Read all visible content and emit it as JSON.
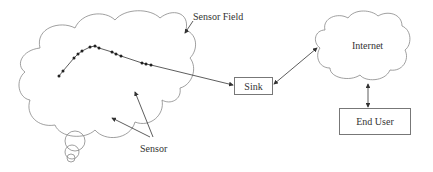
{
  "diagram": {
    "labels": {
      "sensor_field": "Sensor Field",
      "sensor": "Sensor",
      "sink": "Sink",
      "internet": "Internet",
      "end_user": "End User"
    },
    "colors": {
      "stroke": "#777777",
      "node": "#222222",
      "text": "#333333"
    }
  }
}
